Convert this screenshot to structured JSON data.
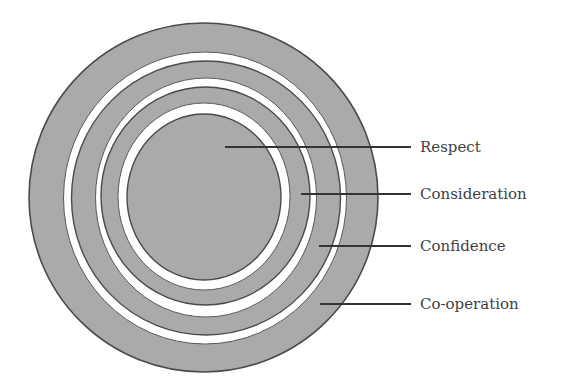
{
  "diagram": {
    "type": "concentric-rings",
    "fill_color": "#aaaaaa",
    "stroke_color": "#4a4a4a",
    "gap_color": "#ffffff",
    "leader_color": "#333333",
    "labels": [
      {
        "text": "Respect",
        "ring": "center"
      },
      {
        "text": "Consideration",
        "ring": "ring-3"
      },
      {
        "text": "Confidence",
        "ring": "ring-2"
      },
      {
        "text": "Co-operation",
        "ring": "outer-ring"
      }
    ]
  }
}
